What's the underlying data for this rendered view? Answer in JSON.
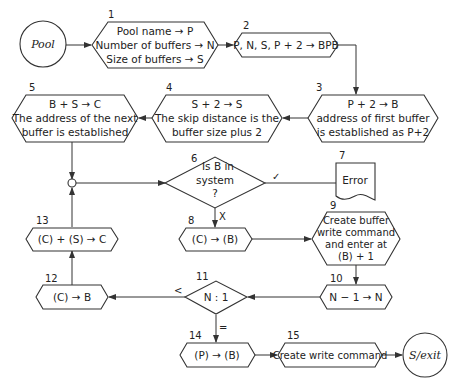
{
  "diagram": {
    "type": "flowchart",
    "terminals": {
      "start": "Pool",
      "end": "S/exit"
    },
    "nodes": [
      {
        "id": "1",
        "number": "1",
        "shape": "hexagon",
        "lines": [
          "Pool name → P",
          "Number of buffers → N",
          "Size of buffers → S"
        ]
      },
      {
        "id": "2",
        "number": "2",
        "shape": "hexagon",
        "lines": [
          "P, N, S, P + 2 → BPB"
        ]
      },
      {
        "id": "3",
        "number": "3",
        "shape": "hexagon",
        "lines": [
          "P + 2 → B",
          "address of first buffer",
          "is established as P+2"
        ]
      },
      {
        "id": "4",
        "number": "4",
        "shape": "hexagon",
        "lines": [
          "S + 2 → S",
          "The skip distance is the",
          "buffer size plus 2"
        ]
      },
      {
        "id": "5",
        "number": "5",
        "shape": "hexagon",
        "lines": [
          "B + S → C",
          "The address of the next",
          "buffer is established"
        ]
      },
      {
        "id": "6",
        "number": "6",
        "shape": "diamond",
        "lines": [
          "Is B in",
          "system",
          "?"
        ]
      },
      {
        "id": "7",
        "number": "7",
        "shape": "document",
        "lines": [
          "Error"
        ]
      },
      {
        "id": "8",
        "number": "8",
        "shape": "hexagon",
        "lines": [
          "(C) → (B)"
        ]
      },
      {
        "id": "9",
        "number": "9",
        "shape": "hexagon",
        "lines": [
          "Create buffer",
          "write command",
          "and enter at",
          "(B) + 1"
        ]
      },
      {
        "id": "10",
        "number": "10",
        "shape": "hexagon",
        "lines": [
          "N − 1 → N"
        ]
      },
      {
        "id": "11",
        "number": "11",
        "shape": "diamond",
        "lines": [
          "N : 1"
        ]
      },
      {
        "id": "12",
        "number": "12",
        "shape": "hexagon",
        "lines": [
          "(C) → B"
        ]
      },
      {
        "id": "13",
        "number": "13",
        "shape": "hexagon",
        "lines": [
          "(C) + (S) → C"
        ]
      },
      {
        "id": "14",
        "number": "14",
        "shape": "hexagon",
        "lines": [
          "(P) → (B)"
        ]
      },
      {
        "id": "15",
        "number": "15",
        "shape": "hexagon",
        "lines": [
          "Create write command"
        ]
      }
    ],
    "edge_labels": {
      "yes": "✓",
      "no": "X",
      "less": "<",
      "equal": "="
    },
    "edges": [
      [
        "start",
        "1"
      ],
      [
        "1",
        "2"
      ],
      [
        "2",
        "3"
      ],
      [
        "3",
        "4"
      ],
      [
        "4",
        "5"
      ],
      [
        "5",
        "junction"
      ],
      [
        "junction",
        "6"
      ],
      [
        "6",
        "7",
        "✓"
      ],
      [
        "6",
        "8",
        "X"
      ],
      [
        "8",
        "9"
      ],
      [
        "9",
        "10"
      ],
      [
        "10",
        "11"
      ],
      [
        "11",
        "12",
        "<"
      ],
      [
        "11",
        "14",
        "="
      ],
      [
        "12",
        "13"
      ],
      [
        "13",
        "junction"
      ],
      [
        "14",
        "15"
      ],
      [
        "15",
        "end"
      ]
    ]
  }
}
